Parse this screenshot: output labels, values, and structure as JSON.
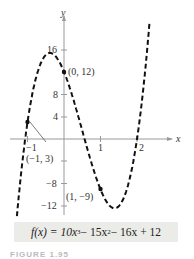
{
  "chart_data": {
    "type": "line",
    "title": "",
    "function": "f(x) = 10x^3 - 15x^2 - 16x + 12",
    "xlabel": "x",
    "ylabel": "y",
    "x_ticks": [
      -1,
      1,
      2
    ],
    "x_tick_labels": [
      "−1",
      "1",
      "2"
    ],
    "y_ticks": [
      16,
      8,
      4,
      -8,
      -12
    ],
    "y_tick_labels": [
      "16",
      "8",
      "4",
      "−8",
      "−12"
    ],
    "xlim": [
      -1.6,
      2.5
    ],
    "ylim": [
      -14,
      24
    ],
    "line_style": "dashed",
    "grid": false,
    "points": [
      {
        "x": 0,
        "y": 12,
        "label": "(0, 12)"
      },
      {
        "x": -1,
        "y": 3,
        "label": "(−1, 3)"
      },
      {
        "x": 1,
        "y": -9,
        "label": "(1, −9)"
      }
    ]
  },
  "formula": {
    "prefix": "f(x) = 10x",
    "exp1": "3",
    "mid1": " − 15x",
    "exp2": "2",
    "rest": " − 16x + 12"
  },
  "caption": "FIGURE 1.95"
}
